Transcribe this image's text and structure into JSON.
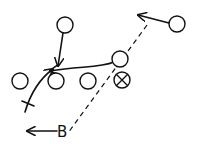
{
  "diagram": {
    "type": "play-diagram",
    "colors": {
      "ink": "#111111",
      "background": "#ffffff"
    },
    "players": [
      {
        "id": "top",
        "cx": 65,
        "cy": 25
      },
      {
        "id": "top-right",
        "cx": 177,
        "cy": 24
      },
      {
        "id": "mid-right",
        "cx": 120,
        "cy": 59
      },
      {
        "id": "row-1",
        "cx": 20,
        "cy": 81
      },
      {
        "id": "row-2",
        "cx": 56,
        "cy": 81
      },
      {
        "id": "row-3",
        "cx": 88,
        "cy": 81
      }
    ],
    "marked_player": {
      "id": "x-player",
      "cx": 122,
      "cy": 80,
      "symbol": "circle-x"
    },
    "labels": {
      "b": "B"
    }
  }
}
